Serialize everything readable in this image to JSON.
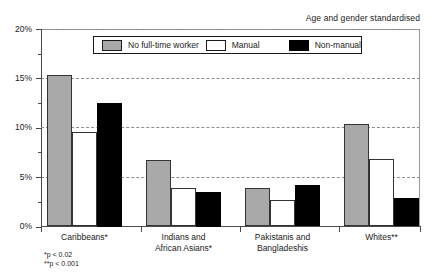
{
  "header": {
    "standardisation_note": "Age and gender standardised"
  },
  "legend": {
    "position": "top-inside",
    "items": [
      {
        "label": "No full-time worker",
        "color": "#a9a9a9",
        "swatch": "grey"
      },
      {
        "label": "Manual",
        "color": "#ffffff",
        "swatch": "white"
      },
      {
        "label": "Non-manual",
        "color": "#000000",
        "swatch": "black"
      }
    ]
  },
  "footnotes": [
    "*p < 0.02",
    "**p < 0.001"
  ],
  "axis": {
    "y_ticks": [
      "0%",
      "5%",
      "10%",
      "15%",
      "20%"
    ],
    "y_minor_present": true,
    "x_groups": [
      "Caribbeans*",
      "Indians and African Asians*",
      "Pakistanis and Bangladeshis",
      "Whites**"
    ]
  },
  "chart_data": {
    "type": "bar",
    "title": "",
    "subtitle": "Age and gender standardised",
    "xlabel": "",
    "ylabel": "",
    "ylim": [
      0,
      20
    ],
    "ytick_values": [
      0,
      5,
      10,
      15,
      20
    ],
    "ytick_labels": [
      "0%",
      "5%",
      "10%",
      "15%",
      "20%"
    ],
    "grid": "horizontal-dashed",
    "legend_position": "top-inside",
    "categories": [
      "Caribbeans*",
      "Indians and African Asians*",
      "Pakistanis and Bangladeshis",
      "Whites**"
    ],
    "series": [
      {
        "name": "No full-time worker",
        "color": "#a9a9a9",
        "values": [
          15.3,
          6.7,
          3.9,
          10.4
        ]
      },
      {
        "name": "Manual",
        "color": "#ffffff",
        "values": [
          9.6,
          3.9,
          2.7,
          6.8
        ]
      },
      {
        "name": "Non-manual",
        "color": "#000000",
        "values": [
          12.5,
          3.5,
          4.2,
          2.9
        ]
      }
    ],
    "annotations": [
      "*p < 0.02",
      "**p < 0.001"
    ]
  }
}
